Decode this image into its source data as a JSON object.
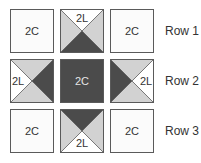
{
  "colors": {
    "plain": "#fbfbfb",
    "dark": "#4b4b4b",
    "light": "#d2d2d2",
    "white_triangle": "#ffffff",
    "border": "#5a5a5a",
    "text_dark": "#333333",
    "text_light": "#e6e6e6"
  },
  "tiles": [
    {
      "row": 1,
      "col": 1,
      "type": "plain",
      "label": "2C"
    },
    {
      "row": 1,
      "col": 2,
      "type": "hst",
      "label": "2L",
      "white": "top",
      "dark": "bottom"
    },
    {
      "row": 1,
      "col": 3,
      "type": "plain",
      "label": "2C"
    },
    {
      "row": 2,
      "col": 1,
      "type": "hst",
      "label": "2L",
      "white": "left",
      "dark": "right"
    },
    {
      "row": 2,
      "col": 2,
      "type": "dark",
      "label": "2C"
    },
    {
      "row": 2,
      "col": 3,
      "type": "hst",
      "label": "2L",
      "white": "right",
      "dark": "left"
    },
    {
      "row": 3,
      "col": 1,
      "type": "plain",
      "label": "2C"
    },
    {
      "row": 3,
      "col": 2,
      "type": "hst",
      "label": "2L",
      "white": "bottom",
      "dark": "top"
    },
    {
      "row": 3,
      "col": 3,
      "type": "plain",
      "label": "2C"
    }
  ],
  "row_labels": [
    "Row 1",
    "Row 2",
    "Row 3"
  ]
}
